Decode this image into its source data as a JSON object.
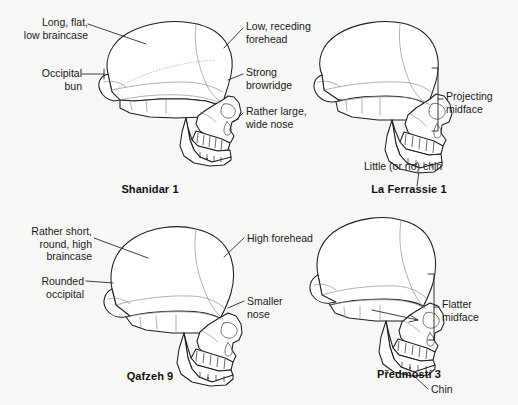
{
  "figure": {
    "background_color": "#f7f7f5",
    "ink_color": "#1d1d1d"
  },
  "panels": [
    {
      "id": "shanidar",
      "caption": "Shanidar 1",
      "group": "neandertal",
      "labels": [
        {
          "id": "long-flat-low-braincase",
          "text": "Long, flat,\nlow braincase",
          "side": "left"
        },
        {
          "id": "occipital-bun",
          "text": "Occipital\nbun",
          "side": "left"
        },
        {
          "id": "low-receding-forehead",
          "text": "Low, receding\nforehead",
          "side": "right"
        },
        {
          "id": "strong-browridge",
          "text": "Strong\nbrowridge",
          "side": "right"
        },
        {
          "id": "rather-large-wide-nose",
          "text": "Rather large,\nwide nose",
          "side": "right"
        }
      ]
    },
    {
      "id": "laferrassie",
      "caption": "La Ferrassie 1",
      "group": "neandertal",
      "labels": [
        {
          "id": "projecting-midface",
          "text": "Projecting\nmidface",
          "side": "right",
          "marker": "bracket"
        },
        {
          "id": "little-or-no-chin",
          "text": "Little (or no) chin",
          "side": "below",
          "marker": "leader"
        }
      ]
    },
    {
      "id": "qafzeh",
      "caption": "Qafzeh 9",
      "group": "early-modern-human",
      "labels": [
        {
          "id": "rather-short-round-high-braincase",
          "text": "Rather short,\nround, high\nbraincase",
          "side": "left"
        },
        {
          "id": "rounded-occipital",
          "text": "Rounded\noccipital",
          "side": "left"
        },
        {
          "id": "high-forehead",
          "text": "High forehead",
          "side": "right"
        },
        {
          "id": "smaller-nose",
          "text": "Smaller\nnose",
          "side": "right"
        }
      ]
    },
    {
      "id": "predmosti",
      "caption": "Předmostí 3",
      "group": "early-modern-human",
      "labels": [
        {
          "id": "flatter-midface",
          "text": "Flatter\nmidface",
          "side": "right",
          "marker": "bracket"
        },
        {
          "id": "chin",
          "text": "Chin",
          "side": "below",
          "marker": "leader"
        }
      ]
    }
  ]
}
